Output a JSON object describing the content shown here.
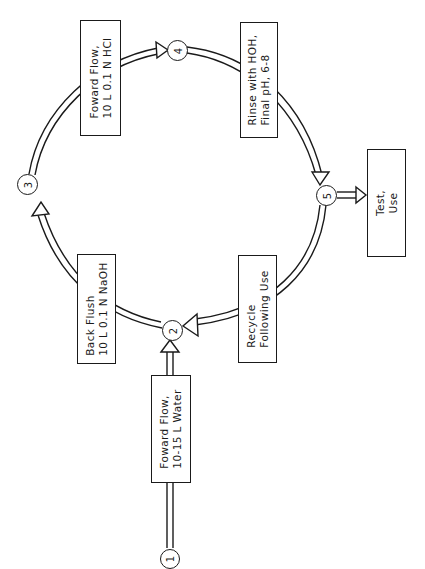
{
  "diagram": {
    "type": "cyclic process flow",
    "orientation": "rotated 90° counter-clockwise (text reads bottom-to-top)",
    "nodes": [
      {
        "id": "1",
        "label": "1"
      },
      {
        "id": "2",
        "label": "2"
      },
      {
        "id": "3",
        "label": "3"
      },
      {
        "id": "4",
        "label": "4"
      },
      {
        "id": "5",
        "label": "5"
      }
    ],
    "steps": [
      {
        "id": "forward-flow-water",
        "lines": [
          "Foward Flow,",
          "10-15 L Water"
        ],
        "from": "1",
        "to": "2"
      },
      {
        "id": "back-flush",
        "lines": [
          "Back Flush",
          "10 L 0.1 N NaOH"
        ],
        "from": "2",
        "to": "3"
      },
      {
        "id": "forward-flow-hcl",
        "lines": [
          "Foward Flow,",
          "10 L 0.1 N HCl"
        ],
        "from": "3",
        "to": "4"
      },
      {
        "id": "rinse",
        "lines": [
          "Rinse with HOH,",
          "Final pH, 6-8"
        ],
        "from": "4",
        "to": "5"
      },
      {
        "id": "recycle",
        "lines": [
          "Recycle",
          "Following Use"
        ],
        "from": "5",
        "to": "2"
      },
      {
        "id": "test-use",
        "lines": [
          "Test,",
          "Use"
        ],
        "from": "5",
        "to": null
      }
    ]
  }
}
